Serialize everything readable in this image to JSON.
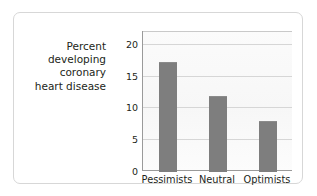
{
  "chart_data": {
    "type": "bar",
    "title": "",
    "subtitle": "",
    "xlabel": "",
    "ylabel": "Percent developing coronary heart disease",
    "categories": [
      "Pessimists",
      "Neutral",
      "Optimists"
    ],
    "values": [
      17.2,
      11.8,
      7.8
    ],
    "ylim": [
      0,
      22
    ],
    "yticks": [
      0,
      5,
      10,
      15,
      20
    ],
    "ytick_labels": [
      "0",
      "5",
      "10",
      "15",
      "20"
    ],
    "grid": "horizontal",
    "legend": "none",
    "bar_color": "#7e7e7e",
    "gridline_color": "#d6d6d6",
    "axis_color": "#9a9a9a",
    "plot_background": "#f7f7f7",
    "card_background": "#ffffff",
    "card_border_color": "#d7d7d7",
    "text_color": "#231f20",
    "annotations": []
  },
  "figure": {
    "axis_title_lines": "Percent\ndeveloping\ncoronary\nheart disease"
  }
}
